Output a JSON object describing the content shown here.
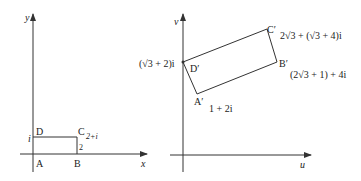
{
  "left_plane": {
    "axis_x_label": "x",
    "axis_y_label": "y",
    "vertices": {
      "A": {
        "label": "A"
      },
      "B": {
        "label": "B"
      },
      "C": {
        "label": "C",
        "value": "2+i"
      },
      "D": {
        "label": "D"
      }
    },
    "tick_x_label": "2",
    "tick_y_label": "i"
  },
  "right_plane": {
    "axis_u_label": "u",
    "axis_v_label": "v",
    "vertices": {
      "A": {
        "label": "A′",
        "value": "1 + 2i"
      },
      "B": {
        "label": "B′",
        "value": "(2√3 + 1) + 4i"
      },
      "C": {
        "label": "C′",
        "value": "2√3 + (√3 + 4)i"
      },
      "D": {
        "label": "D′",
        "value": "(√3 + 2)i"
      }
    }
  },
  "colors": {
    "line": "#333333",
    "text": "#222222",
    "background": "#ffffff"
  }
}
